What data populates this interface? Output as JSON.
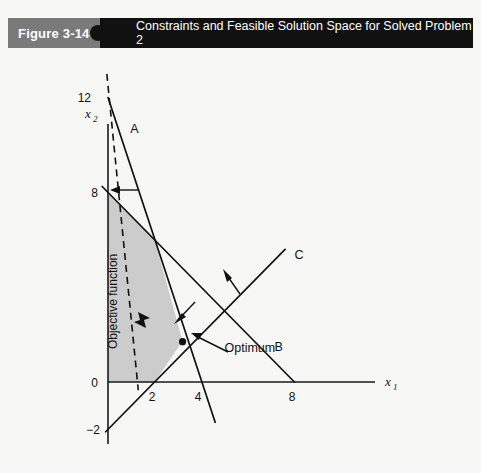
{
  "header": {
    "figure_tag": "Figure 3-14",
    "title": "Constraints and Feasible Solution Space for Solved Problem 2",
    "tag_bg": "#7a7a7a",
    "title_bg": "#111111",
    "text_color": "#ffffff"
  },
  "chart_data": {
    "type": "line",
    "title": "Constraints and Feasible Solution Space for Solved Problem 2",
    "xlabel": "x1",
    "ylabel": "x2",
    "xlim": [
      -0.6,
      11.5
    ],
    "ylim": [
      -2.6,
      13.2
    ],
    "grid": false,
    "legend": "none",
    "x_ticks": [
      2,
      4,
      8
    ],
    "x_tick_labels": [
      "2",
      "4",
      "8"
    ],
    "y_ticks": [
      -2,
      0,
      8,
      12
    ],
    "y_tick_labels": [
      "−2",
      "0",
      "8",
      "12"
    ],
    "axis_labels": {
      "x": "x",
      "x_sub": "1",
      "y": "x",
      "y_sub": "2"
    },
    "series": [
      {
        "name": "A",
        "label": "A",
        "kind": "constraint",
        "points": [
          [
            0,
            12
          ],
          [
            4.6,
            -1.7
          ]
        ],
        "intercepts": {
          "y": 12,
          "x": 4
        },
        "label_pos": [
          0.95,
          10.5
        ],
        "feasible_direction": "toward-origin"
      },
      {
        "name": "B",
        "label": "B",
        "kind": "constraint",
        "points": [
          [
            -0.25,
            8.25
          ],
          [
            8,
            0
          ]
        ],
        "intercepts": {
          "y": 8,
          "x": 8
        },
        "label_pos": [
          7.15,
          1.3
        ],
        "feasible_direction": "toward-origin"
      },
      {
        "name": "C",
        "label": "C",
        "kind": "constraint",
        "points": [
          [
            -0.1,
            -2.1
          ],
          [
            7.6,
            5.6
          ]
        ],
        "intercepts": {
          "y": -2,
          "x": 2
        },
        "label_pos": [
          8.0,
          5.2
        ],
        "feasible_direction": "away-from-origin"
      },
      {
        "name": "Objective function",
        "label": "Objective function",
        "kind": "objective",
        "style": "dashed",
        "points": [
          [
            -0.05,
            13.0
          ],
          [
            1.3,
            -0.35
          ]
        ],
        "label_pos": [
          0.38,
          3.4
        ],
        "label_rotation": -90
      }
    ],
    "annotations": [
      {
        "name": "optimum",
        "label": "Optimum",
        "point": [
          3.2,
          1.7
        ],
        "marker": "filled-circle",
        "label_pos": [
          5.0,
          1.45
        ]
      },
      {
        "name": "objective-direction-arrow",
        "label": "",
        "marker": "solid-arrow-right",
        "point": [
          1.55,
          2.9
        ]
      },
      {
        "name": "constraint-b-direction",
        "label": "",
        "marker": "arrow",
        "point": [
          0.1,
          8.0
        ]
      },
      {
        "name": "constraint-a-direction",
        "label": "",
        "marker": "arrow",
        "point": [
          3.1,
          5.4
        ]
      },
      {
        "name": "constraint-c-direction",
        "label": "",
        "marker": "arrow",
        "point": [
          5.2,
          6.5
        ]
      }
    ],
    "feasible_region": {
      "label": "Feasible Solution Space",
      "fill": "#c9c9c9",
      "vertices": [
        [
          0,
          0
        ],
        [
          0,
          8
        ],
        [
          2.02,
          5.95
        ],
        [
          3.2,
          1.72
        ],
        [
          2.0,
          0
        ]
      ]
    }
  }
}
